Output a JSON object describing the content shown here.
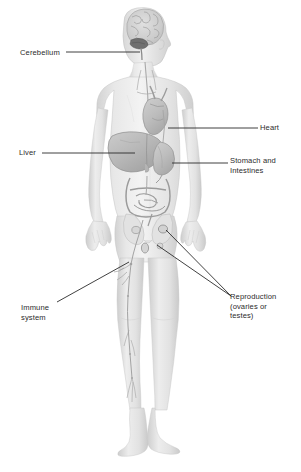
{
  "figure": {
    "background_color": "#ffffff",
    "line_color": "#2b2b2b",
    "text_color": "#2b2b2b",
    "body_fill_light": "#ececec",
    "body_fill_mid": "#dcdcdc",
    "body_fill_shadow": "#c8c8c8",
    "organ_fill": "#c2c2c2",
    "organ_fill_dark": "#a8a8a8"
  },
  "labels": {
    "cerebellum": "Cerebellum",
    "heart": "Heart",
    "liver": "Liver",
    "stomach_intestines": "Stomach and\nIntestines",
    "immune_system": "Immune\nsystem",
    "reproduction": "Reproduction\n(ovaries or\ntestes)"
  },
  "annotations": [
    {
      "name": "cerebellum",
      "label": "Cerebellum",
      "side": "left",
      "target": "cerebellum-in-brain"
    },
    {
      "name": "heart",
      "label": "Heart",
      "side": "right",
      "target": "heart"
    },
    {
      "name": "liver",
      "label": "Liver",
      "side": "left",
      "target": "liver"
    },
    {
      "name": "stomach-intestines",
      "label": "Stomach and Intestines",
      "side": "right",
      "target": "stomach"
    },
    {
      "name": "immune-system",
      "label": "Immune system",
      "side": "left",
      "target": "lymphatic-vessel-leg"
    },
    {
      "name": "reproduction",
      "label": "Reproduction (ovaries or testes)",
      "side": "right",
      "target": "gonads"
    }
  ]
}
